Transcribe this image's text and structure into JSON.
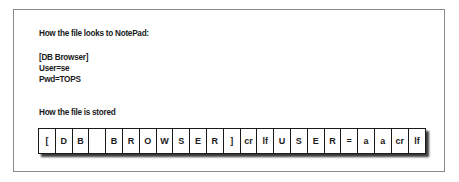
{
  "figure": {
    "notepad_heading": "How the file looks to NotePad:",
    "notepad_lines": [
      "[DB Browser]",
      "User=se",
      "Pwd=TOPS"
    ],
    "stored_heading": "How the file is stored",
    "stored_cells": [
      "[",
      "D",
      "B",
      "",
      "B",
      "R",
      "O",
      "W",
      "S",
      "E",
      "R",
      "]",
      "cr",
      "lf",
      "U",
      "S",
      "E",
      "R",
      "=",
      "a",
      "a",
      "cr",
      "lf"
    ]
  }
}
